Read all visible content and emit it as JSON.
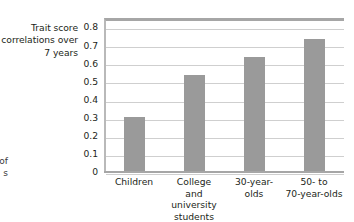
{
  "axis_title": {
    "lines": [
      "Trait score",
      "correlations over",
      "7 years"
    ]
  },
  "clipped_caption": {
    "lines": [
      "of",
      "s"
    ]
  },
  "colors": {
    "bar": "#9a9a9a",
    "gridline": "#cfcfcf",
    "axis": "#a6a6a6",
    "text": "#231f20",
    "background": "#ffffff"
  },
  "chart_data": {
    "type": "bar",
    "title": "",
    "subtitle": "",
    "xlabel": "",
    "ylabel": "Trait score correlations over 7 years",
    "categories": [
      "Children",
      "College and university students",
      "30-year-olds",
      "50- to 70-year-olds"
    ],
    "category_label_lines": [
      [
        "Children"
      ],
      [
        "College",
        "and",
        "university",
        "students"
      ],
      [
        "30-year-",
        "olds"
      ],
      [
        "50- to",
        "70-year-olds"
      ]
    ],
    "values": [
      0.305,
      0.535,
      0.635,
      0.735
    ],
    "ylim": [
      0,
      0.85
    ],
    "yticks": [
      0,
      0.1,
      0.2,
      0.3,
      0.4,
      0.5,
      0.6,
      0.7,
      0.8
    ],
    "ytick_labels": [
      "0",
      "0.1",
      "0.2",
      "0.3",
      "0.4",
      "0.5",
      "0.6",
      "0.7",
      "0.8"
    ],
    "grid": true,
    "legend": null,
    "legend_position": "none",
    "annotations": []
  }
}
